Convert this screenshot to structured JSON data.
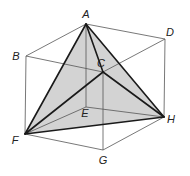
{
  "diagram": {
    "shade_color": "#d3d3d3",
    "vertices": {
      "A": {
        "x": 86,
        "y": 24,
        "label": "A",
        "lx": 86,
        "ly": 18
      },
      "B": {
        "x": 26,
        "y": 56,
        "label": "B",
        "lx": 16,
        "ly": 60
      },
      "C": {
        "x": 103,
        "y": 72,
        "label": "C",
        "lx": 101,
        "ly": 67
      },
      "D": {
        "x": 165,
        "y": 39,
        "label": "D",
        "lx": 170,
        "ly": 36
      },
      "E": {
        "x": 86,
        "y": 107,
        "label": "E",
        "lx": 85,
        "ly": 117
      },
      "F": {
        "x": 25,
        "y": 134,
        "label": "F",
        "lx": 15,
        "ly": 144
      },
      "G": {
        "x": 103,
        "y": 150,
        "label": "G",
        "lx": 103,
        "ly": 164
      },
      "H": {
        "x": 164,
        "y": 117,
        "label": "H",
        "lx": 171,
        "ly": 123
      }
    },
    "cube_edges": [
      [
        "A",
        "B"
      ],
      [
        "A",
        "D"
      ],
      [
        "B",
        "C"
      ],
      [
        "C",
        "D"
      ],
      [
        "B",
        "F"
      ],
      [
        "C",
        "G"
      ],
      [
        "D",
        "H"
      ],
      [
        "F",
        "G"
      ],
      [
        "G",
        "H"
      ],
      [
        "A",
        "E"
      ],
      [
        "E",
        "F"
      ],
      [
        "E",
        "H"
      ]
    ],
    "tetrahedron_edges": [
      [
        "A",
        "C"
      ],
      [
        "A",
        "F"
      ],
      [
        "A",
        "H"
      ],
      [
        "C",
        "F"
      ],
      [
        "C",
        "H"
      ],
      [
        "F",
        "H"
      ]
    ],
    "shaded_faces": [
      [
        "A",
        "F",
        "H"
      ]
    ],
    "labels": [
      "A",
      "B",
      "C",
      "D",
      "E",
      "F",
      "G",
      "H"
    ]
  }
}
